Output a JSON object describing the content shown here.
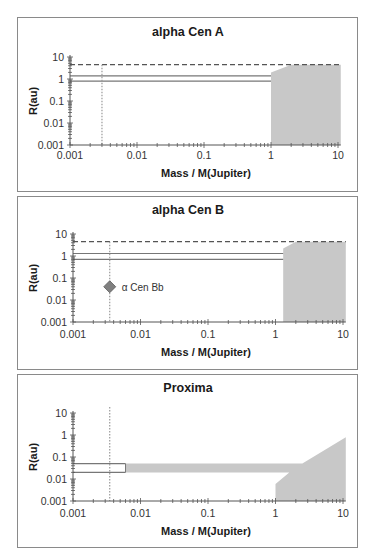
{
  "figure": {
    "shared": {
      "xlabel": "Mass / M(Jupiter)",
      "ylabel": "R(au)",
      "x_ticks": [
        "0.001",
        "0.01",
        "0.1",
        "1",
        "10"
      ],
      "y_ticks": [
        "0.001",
        "0.01",
        "0.1",
        "1",
        "10"
      ]
    },
    "colors": {
      "frame": "#8a8a8a",
      "axis": "#555555",
      "excluded_region": "#c8c8c8",
      "dashed_line": "#555555",
      "hz_lines": "#777777",
      "dotted_line": "#999999",
      "planet_marker": "#808080"
    }
  },
  "chart_data": [
    {
      "type": "area",
      "title": "alpha Cen A",
      "xlabel": "Mass / M(Jupiter)",
      "ylabel": "R(au)",
      "xscale": "log",
      "yscale": "log",
      "xlim": [
        0.001,
        10
      ],
      "ylim": [
        0.001,
        10
      ],
      "x_ticks": [
        0.001,
        0.01,
        0.1,
        1,
        10
      ],
      "y_ticks": [
        0.001,
        0.01,
        0.1,
        1,
        10
      ],
      "grid": false,
      "dashed_hline": 4.5,
      "solid_hlines": [
        1.4,
        0.8
      ],
      "solid_hline_xrange": [
        0.001,
        1
      ],
      "dotted_vline": 0.003,
      "excluded_region": {
        "polygon": [
          [
            1,
            0.001
          ],
          [
            1,
            2.0
          ],
          [
            2,
            4.5
          ],
          [
            11,
            4.5
          ],
          [
            11,
            0.001
          ]
        ]
      }
    },
    {
      "type": "area",
      "title": "alpha Cen B",
      "xlabel": "Mass / M(Jupiter)",
      "ylabel": "R(au)",
      "xscale": "log",
      "yscale": "log",
      "xlim": [
        0.001,
        10
      ],
      "ylim": [
        0.001,
        10
      ],
      "x_ticks": [
        0.001,
        0.01,
        0.1,
        1,
        10
      ],
      "y_ticks": [
        0.001,
        0.01,
        0.1,
        1,
        10
      ],
      "grid": false,
      "dashed_hline": 4.5,
      "solid_hlines": [
        1.3,
        0.7
      ],
      "solid_hline_xrange": [
        0.001,
        1.3
      ],
      "dotted_vline": 0.0035,
      "planet": {
        "label": "α Cen Bb",
        "mass": 0.0035,
        "r": 0.04
      },
      "excluded_region": {
        "polygon": [
          [
            1.3,
            0.001
          ],
          [
            1.3,
            2.2
          ],
          [
            2,
            4.5
          ],
          [
            11,
            4.5
          ],
          [
            11,
            0.001
          ]
        ]
      }
    },
    {
      "type": "area",
      "title": "Proxima",
      "xlabel": "Mass / M(Jupiter)",
      "ylabel": "R(au)",
      "xscale": "log",
      "yscale": "log",
      "xlim": [
        0.001,
        10
      ],
      "ylim": [
        0.001,
        10
      ],
      "x_ticks": [
        0.001,
        0.01,
        0.1,
        1,
        10
      ],
      "y_ticks": [
        0.001,
        0.01,
        0.1,
        1,
        10
      ],
      "grid": false,
      "dotted_vline": 0.0035,
      "band": {
        "r_min": 0.02,
        "r_max": 0.05,
        "outline_xrange": [
          0.001,
          0.006
        ],
        "filled_from": 0.006
      },
      "excluded_region": {
        "polygon": [
          [
            0.006,
            0.05
          ],
          [
            2.5,
            0.05
          ],
          [
            11,
            0.8
          ],
          [
            11,
            0.001
          ],
          [
            1,
            0.001
          ],
          [
            1,
            0.006
          ],
          [
            1.6,
            0.02
          ],
          [
            0.006,
            0.02
          ]
        ]
      }
    }
  ]
}
